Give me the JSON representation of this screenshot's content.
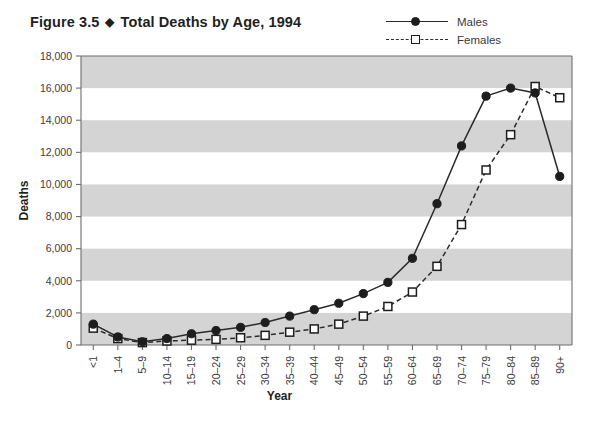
{
  "figure": {
    "number": "Figure 3.5",
    "separator": "◆",
    "title": "Total Deaths by Age, 1994"
  },
  "legend": {
    "position": "top-right",
    "entries": [
      {
        "label": "Males",
        "marker": "filled-circle",
        "line": "solid"
      },
      {
        "label": "Females",
        "marker": "open-square",
        "line": "dashed"
      }
    ]
  },
  "chart_data": {
    "type": "line",
    "title": "Total Deaths by Age, 1994",
    "xlabel": "Year",
    "ylabel": "Deaths",
    "ylim": [
      0,
      18000
    ],
    "ytick_step": 2000,
    "ytick_labels": [
      "0",
      "2,000",
      "4,000",
      "6,000",
      "8,000",
      "10,000",
      "12,000",
      "14,000",
      "16,000",
      "18,000"
    ],
    "grid": "alternating-horizontal-bands",
    "legend_position": "top-right",
    "categories": [
      "<1",
      "1–4",
      "5–9",
      "10–14",
      "15–19",
      "20–24",
      "25–29",
      "30–34",
      "35–39",
      "40–44",
      "45–49",
      "50–54",
      "55–59",
      "60–64",
      "65–69",
      "70–74",
      "75–79",
      "80–84",
      "85–89",
      "90+"
    ],
    "series": [
      {
        "name": "Males",
        "marker": "filled-circle",
        "line": "solid",
        "values": [
          1300,
          500,
          200,
          400,
          700,
          900,
          1100,
          1400,
          1800,
          2200,
          2600,
          3200,
          3900,
          5400,
          8800,
          12400,
          15500,
          16000,
          15700,
          10500
        ]
      },
      {
        "name": "Females",
        "marker": "open-square",
        "line": "dashed",
        "values": [
          1050,
          400,
          150,
          250,
          300,
          350,
          450,
          600,
          800,
          1000,
          1300,
          1800,
          2400,
          3300,
          4900,
          7500,
          10900,
          13100,
          16100,
          15400
        ]
      }
    ],
    "males_last_point": 6600,
    "females_last_point": 15900
  }
}
